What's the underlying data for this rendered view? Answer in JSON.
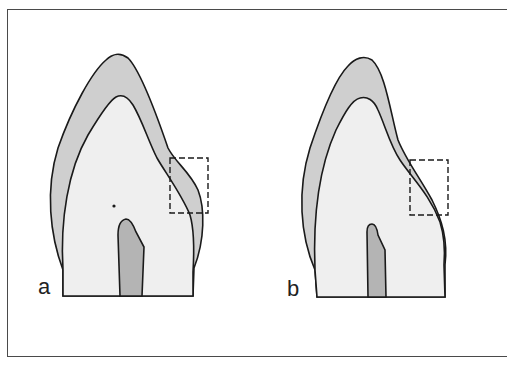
{
  "figure": {
    "panels": [
      {
        "label": "a",
        "description": "Tooth section with enamel bulge in dashed region"
      },
      {
        "label": "b",
        "description": "Tooth section with reduced enamel in dashed region"
      }
    ],
    "colors": {
      "enamel": "#cfcfcf",
      "dentin": "#efefef",
      "pulp": "#b4b4b4",
      "outline": "#1a1a1a",
      "frame": "#4a4a4a"
    }
  }
}
